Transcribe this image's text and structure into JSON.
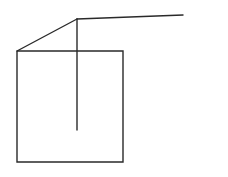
{
  "canvas": {
    "width": 228,
    "height": 177,
    "background_color": "#ffffff"
  },
  "drawing": {
    "stroke_color": "#2a2a2a",
    "stroke_width": 1.4,
    "polylines": [
      {
        "name": "square-outline",
        "points": [
          [
            17,
            51
          ],
          [
            123,
            51
          ],
          [
            123,
            162
          ],
          [
            17,
            162
          ],
          [
            17,
            51
          ]
        ]
      },
      {
        "name": "diagonal-line",
        "points": [
          [
            17,
            51
          ],
          [
            77,
            19
          ]
        ]
      },
      {
        "name": "horizontal-ray",
        "points": [
          [
            77,
            19
          ],
          [
            183,
            15
          ]
        ]
      },
      {
        "name": "vertical-drop-line",
        "points": [
          [
            77,
            19
          ],
          [
            77,
            130
          ]
        ]
      }
    ]
  }
}
